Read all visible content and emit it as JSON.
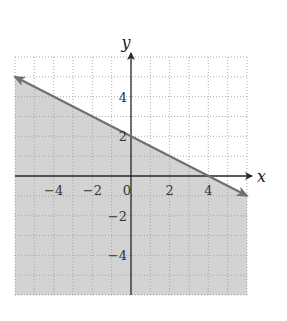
{
  "chart_data": {
    "type": "line",
    "title": "",
    "xlabel": "x",
    "ylabel": "y",
    "xlim": [
      -6,
      6
    ],
    "ylim": [
      -6,
      6
    ],
    "grid": true,
    "grid_style": "dotted",
    "x_ticks": [
      -4,
      -2,
      0,
      2,
      4
    ],
    "y_ticks": [
      4,
      2,
      -2,
      -4
    ],
    "x_tick_labels": [
      "−4",
      "−2",
      "0",
      "2",
      "4"
    ],
    "y_tick_labels": [
      "4",
      "2",
      "−2",
      "−4"
    ],
    "series": [
      {
        "name": "boundary line",
        "equation": "y = -1/2 x + 2",
        "x": [
          -6,
          0,
          4,
          6
        ],
        "y": [
          5,
          2,
          0,
          -1
        ],
        "style": "solid",
        "arrows": "both"
      }
    ],
    "shaded_region": {
      "description": "half-plane below the line",
      "inequality": "y <= -1/2 x + 2"
    },
    "colors": {
      "shade": "#d3d3d3",
      "line": "#707070",
      "axes": "#2a2a2a",
      "grid": "#9a9a9a"
    }
  }
}
